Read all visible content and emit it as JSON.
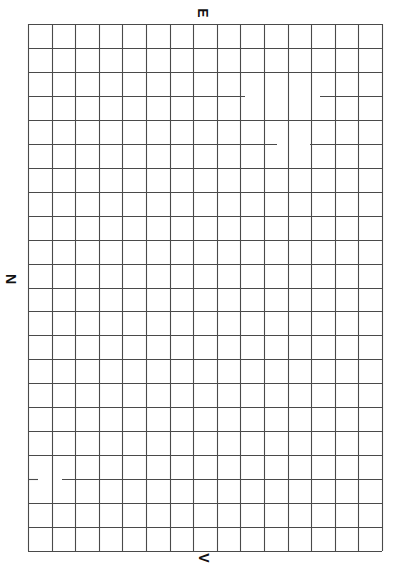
{
  "sheet": {
    "type": "blank grid paper",
    "grid": {
      "columns": 15,
      "rows": 22,
      "left": 28,
      "top": 24,
      "right": 382,
      "bottom": 551,
      "line_color": "#4a4a4a",
      "background": "#ffffff"
    },
    "labels": {
      "top": "E",
      "left": "N",
      "bottom": "V"
    },
    "label_rotation_deg": 90,
    "faded_line_segments": [
      {
        "row_line": 3,
        "x_from": 245,
        "x_to": 320
      },
      {
        "row_line": 5,
        "x_from": 277,
        "x_to": 310
      },
      {
        "row_line": 19,
        "x_from": 38,
        "x_to": 62
      }
    ]
  }
}
